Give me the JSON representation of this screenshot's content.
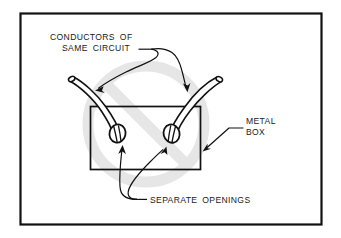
{
  "figure": {
    "kind": "technical-line-drawing",
    "border_color": "#111111",
    "background_color": "#ffffff",
    "ink_color": "#1a1a1a",
    "watermark": {
      "name": "prohibition-symbol",
      "shape": "circle-with-diagonal-slash",
      "color": "#e6e6e6",
      "center_x": 146,
      "center_y": 124,
      "radius": 58,
      "stroke_width": 11
    }
  },
  "labels": {
    "conductors": {
      "line1": "CONDUCTORS  OF",
      "line2": "SAME  CIRCUIT"
    },
    "metal_box": {
      "line1": "METAL",
      "line2": "BOX"
    },
    "separate_openings": {
      "line1": "SEPARATE  OPENINGS"
    }
  },
  "parts": {
    "metal_box": {
      "name": "metal-box",
      "x": 90,
      "y": 106,
      "width": 111,
      "height": 64
    },
    "conductor_left": {
      "name": "conductor-left"
    },
    "conductor_right": {
      "name": "conductor-right"
    },
    "opening_left": {
      "name": "opening-left"
    },
    "opening_right": {
      "name": "opening-right"
    }
  }
}
